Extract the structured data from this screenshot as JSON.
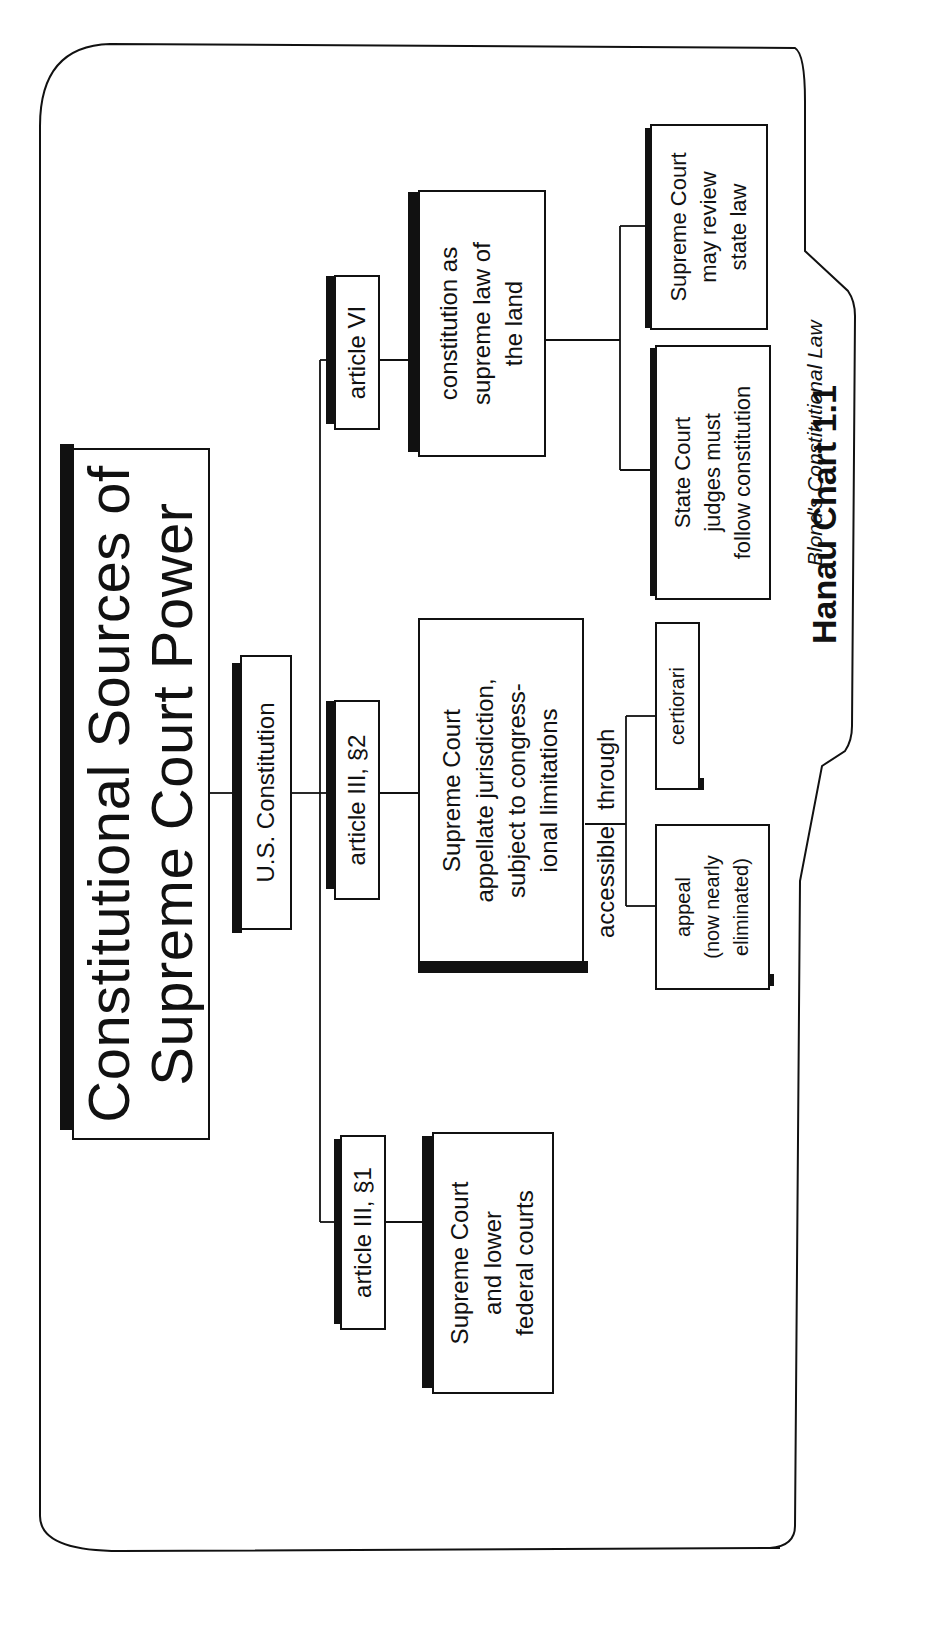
{
  "title": "Constitutional Sources of Supreme Court Power",
  "title_lines": [
    "Constitutional Sources of",
    "Supreme Court Power"
  ],
  "nodes": {
    "root": "U.S. Constitution",
    "art3s1": "article III, §1",
    "art3s1_child": "Supreme Court\nand lower\nfederal courts",
    "art3s2": "article III, §2",
    "art3s2_child": "Supreme Court\nappellate jurisdiction,\nsubject to congress-\nional limitations",
    "art6": "article VI",
    "art6_child": "constitution as\nsupreme law of\nthe land",
    "certiorari": "certiorari",
    "appeal": "appeal\n(now nearly\neliminated)",
    "state_court": "State Court\njudges must\nfollow constitution",
    "sc_review": "Supreme Court\nmay review\nstate law"
  },
  "edge_labels": {
    "accessible": "accessible",
    "through": "through"
  },
  "footer": {
    "chart_id": "Hanau Chart 1.1",
    "credit": "Blond's Constitutional Law"
  },
  "colors": {
    "ink": "#111111",
    "background": "#ffffff"
  }
}
